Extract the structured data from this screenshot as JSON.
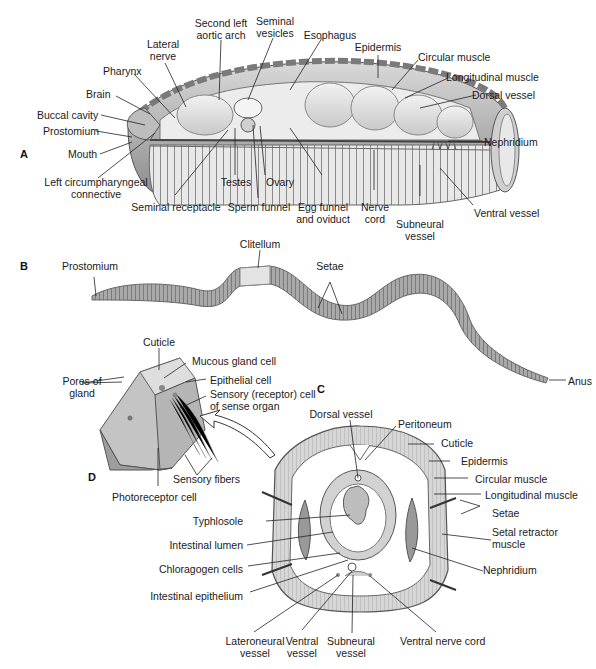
{
  "figure": {
    "panels": {
      "A": "A",
      "B": "B",
      "C": "C",
      "D": "D"
    },
    "colors": {
      "background": "#ffffff",
      "tissue_light": "#e6e6e6",
      "tissue_mid": "#bdbdbd",
      "tissue_dark": "#7a7a7a",
      "line": "#222222"
    }
  },
  "panel_a": {
    "title": "Earthworm internal anatomy (lateral cutaway)",
    "labels": {
      "second_left_aortic_arch": "Second left\naortic arch",
      "seminal_vesicles": "Seminal\nvesicles",
      "lateral_nerve": "Lateral\nnerve",
      "esophagus": "Esophagus",
      "epidermis": "Epidermis",
      "pharynx": "Pharynx",
      "circular_muscle": "Circular muscle",
      "brain": "Brain",
      "longitudinal_muscle": "Longitudinal muscle",
      "dorsal_vessel": "Dorsal vessel",
      "buccal_cavity": "Buccal cavity",
      "prostomium": "Prostomium",
      "nephridium": "Nephridium",
      "mouth": "Mouth",
      "left_circumpharyngeal_connective": "Left circumpharyngeal\nconnective",
      "testes": "Testes",
      "ovary": "Ovary",
      "seminal_receptacle": "Seminal receptacle",
      "sperm_funnel": "Sperm funnel",
      "egg_funnel_and_oviduct": "Egg funnel\nand oviduct",
      "nerve_cord": "Nerve\ncord",
      "subneural_vessel": "Subneural\nvessel",
      "ventral_vessel": "Ventral vessel"
    }
  },
  "panel_b": {
    "title": "Earthworm external view",
    "labels": {
      "prostomium": "Prostomium",
      "clitellum": "Clitellum",
      "setae": "Setae",
      "anus": "Anus"
    }
  },
  "panel_c": {
    "title": "Cross section",
    "labels": {
      "dorsal_vessel": "Dorsal vessel",
      "peritoneum": "Peritoneum",
      "cuticle": "Cuticle",
      "epidermis": "Epidermis",
      "circular_muscle": "Circular muscle",
      "longitudinal_muscle": "Longitudinal muscle",
      "setae": "Setae",
      "setal_retractor_muscle": "Setal retractor\nmuscle",
      "nephridium": "Nephridium",
      "typhlosole": "Typhlosole",
      "intestinal_lumen": "Intestinal lumen",
      "chloragogen_cells": "Chloragogen cells",
      "intestinal_epithelium": "Intestinal epithelium",
      "lateroneural_vessel": "Lateroneural\nvessel",
      "ventral_vessel": "Ventral\nvessel",
      "subneural_vessel": "Subneural\nvessel",
      "ventral_nerve_cord": "Ventral nerve cord"
    }
  },
  "panel_d": {
    "title": "Epidermis detail",
    "labels": {
      "cuticle": "Cuticle",
      "mucous_gland_cell": "Mucous gland cell",
      "pores_of_gland": "Pores of\ngland",
      "epithelial_cell": "Epithelial cell",
      "sensory_receptor_cell": "Sensory (receptor) cell\nof sense organ",
      "sensory_fibers": "Sensory fibers",
      "photoreceptor_cell": "Photoreceptor cell"
    }
  }
}
